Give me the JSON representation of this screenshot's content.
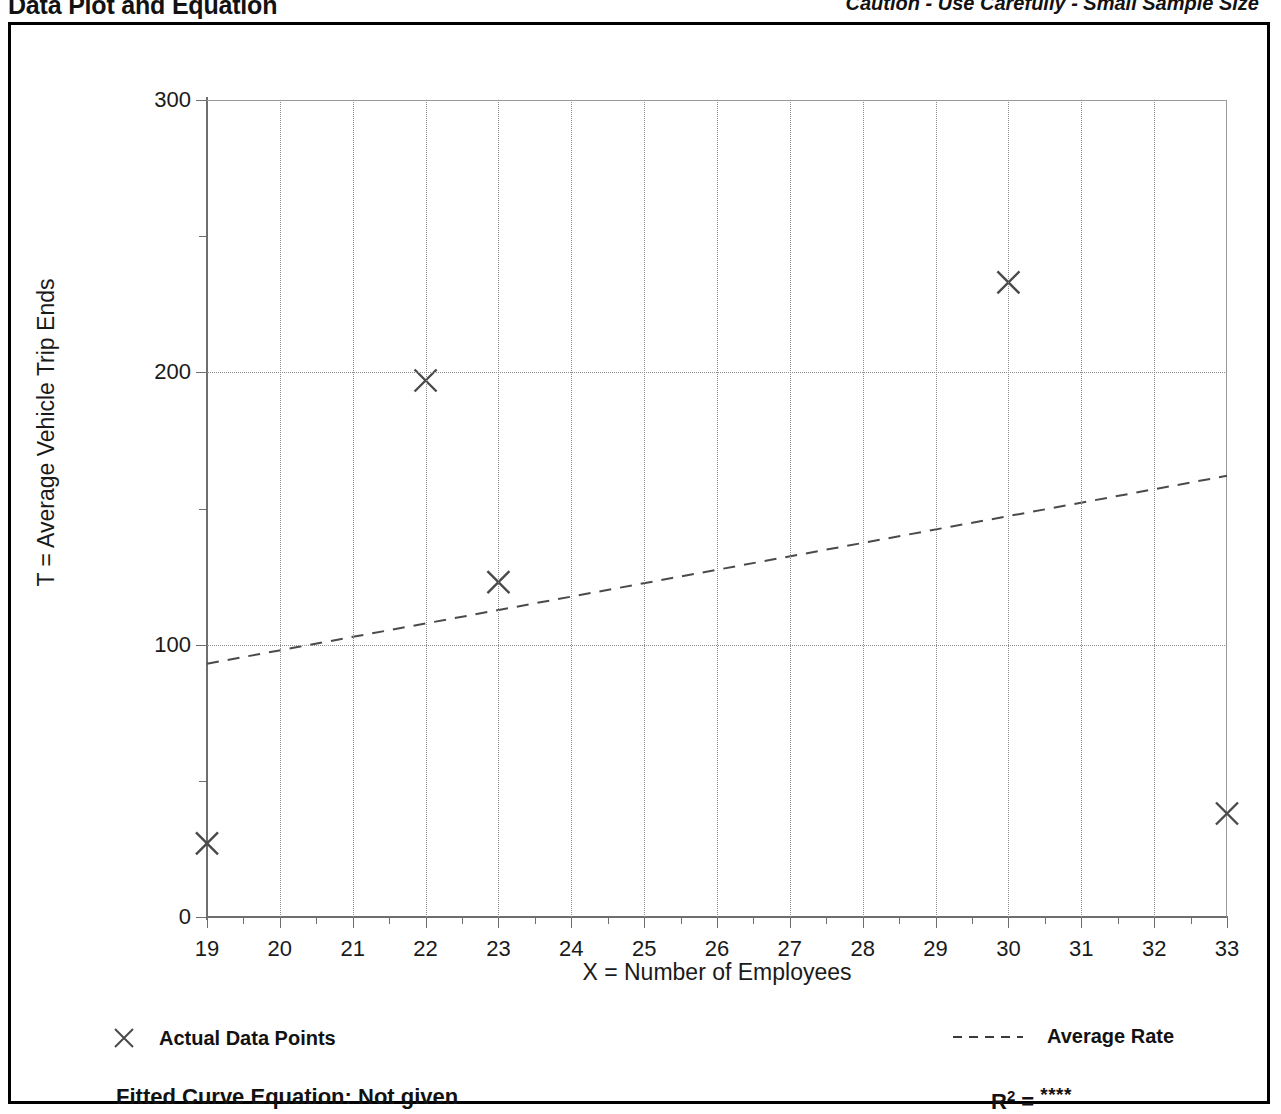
{
  "header": {
    "title": "Data Plot and Equation",
    "caution": "Caution - Use Carefully - Small Sample Size"
  },
  "legend": {
    "data_points_label": "Actual Data Points",
    "average_rate_label": "Average Rate",
    "data_points_marker": "x-marker-icon",
    "average_rate_marker": "dashed-line-icon"
  },
  "footer": {
    "equation_label": "Fitted Curve Equation:  Not given",
    "r_squared_symbol": "R",
    "r_squared_exponent": "2",
    "r_squared_equals": " = ",
    "r_squared_value": "****"
  },
  "colors": {
    "ink": "#1a1a1a",
    "axis": "#6e6e6e",
    "grid": "#8c8c8c",
    "frame": "#000000",
    "marker": "#4a4a4a",
    "fit_line": "#4a4a4a"
  },
  "chart_data": {
    "type": "scatter",
    "title": "Data Plot and Equation",
    "subtitle": "Caution - Use Carefully - Small Sample Size",
    "xlabel": "X = Number of Employees",
    "ylabel": "T = Average Vehicle Trip Ends",
    "xlim": [
      19,
      33
    ],
    "ylim": [
      0,
      300
    ],
    "grid": true,
    "legend_position": "bottom",
    "x_ticks": [
      19,
      20,
      21,
      22,
      23,
      24,
      25,
      26,
      27,
      28,
      29,
      30,
      31,
      32,
      33
    ],
    "x_tick_labels": [
      "19",
      "20",
      "21",
      "22",
      "23",
      "24",
      "25",
      "26",
      "27",
      "28",
      "29",
      "30",
      "31",
      "32",
      "33"
    ],
    "x_minor_ticks": [
      19.5,
      20.5,
      21.5,
      22.5,
      23.5,
      24.5,
      25.5,
      26.5,
      27.5,
      28.5,
      29.5,
      30.5,
      31.5,
      32.5
    ],
    "y_ticks": [
      0,
      100,
      200,
      300
    ],
    "y_tick_labels": [
      "0",
      "100",
      "200",
      "300"
    ],
    "y_minor_ticks": [
      50,
      150,
      250
    ],
    "y_gridlines": [
      100,
      200
    ],
    "series": [
      {
        "name": "Actual Data Points",
        "type": "scatter",
        "marker": "x",
        "points": [
          {
            "x": 19,
            "y": 27
          },
          {
            "x": 22,
            "y": 197
          },
          {
            "x": 23,
            "y": 123
          },
          {
            "x": 30,
            "y": 233
          },
          {
            "x": 33,
            "y": 38
          }
        ]
      },
      {
        "name": "Average Rate",
        "type": "line",
        "style": "dashed",
        "points": [
          {
            "x": 19,
            "y": 93
          },
          {
            "x": 33,
            "y": 162
          }
        ]
      }
    ],
    "annotations": [
      "Fitted Curve Equation:  Not given",
      "R2 = ****"
    ]
  }
}
